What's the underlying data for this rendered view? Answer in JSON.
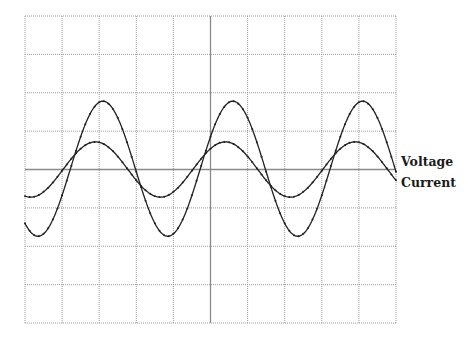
{
  "chart_data": {
    "type": "line",
    "title": "",
    "xlabel": "",
    "ylabel": "",
    "style": "oscilloscope",
    "grid": {
      "on": true,
      "columns": 10,
      "rows": 8,
      "center_axes_solid": true
    },
    "xlim": [
      0,
      10
    ],
    "ylim": [
      -4,
      4
    ],
    "units": "divisions",
    "series": [
      {
        "name": "Voltage",
        "waveform": "sine",
        "amplitude_div": 1.76,
        "offset_div": 0.02,
        "period_div": 3.5,
        "peak_positions_div": [
          2.1,
          5.6,
          9.1
        ],
        "trough_positions_div": [
          0.35,
          3.9,
          7.4
        ],
        "color": "#222222"
      },
      {
        "name": "Current",
        "waveform": "sine",
        "amplitude_div": 0.72,
        "offset_div": 0.0,
        "period_div": 3.5,
        "peak_positions_div": [
          1.9,
          5.3,
          8.85
        ],
        "trough_positions_div": [
          0.1,
          3.6,
          7.1
        ],
        "color": "#222222",
        "phase_relation": "leads voltage by ~0.2 div"
      }
    ],
    "legend": {
      "position": "right",
      "entries": [
        "Voltage",
        "Current"
      ]
    }
  },
  "legend": {
    "voltage_label": "Voltage",
    "current_label": "Current"
  }
}
